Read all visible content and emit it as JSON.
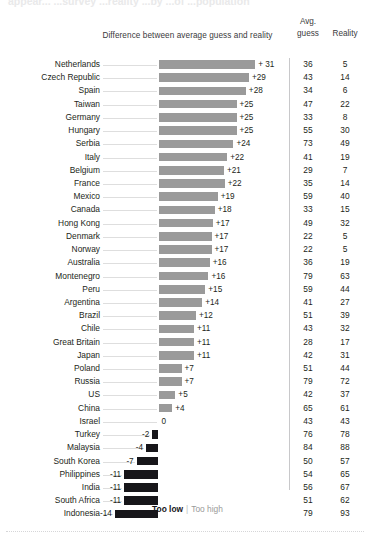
{
  "headline_ghost": "appear... ...survey ...reality ...by ...of ...population",
  "headers": {
    "difference": "Difference between average guess and reality",
    "avg_line1": "Avg.",
    "avg_line2": "guess",
    "reality": "Reality"
  },
  "legend": {
    "too_low": "Too low",
    "separator": "|",
    "too_high": "Too high"
  },
  "colors": {
    "positive_bar": "#9a9a9a",
    "negative_bar": "#17161a",
    "leader_line": "#dedede",
    "divider": "#c8c8ca",
    "text": "#231f20"
  },
  "chart_data": {
    "type": "bar",
    "title": "Difference between average guess and reality",
    "xlabel": "",
    "ylabel": "",
    "orientation": "horizontal",
    "grid": false,
    "legend_position": "bottom",
    "columns": [
      "Country",
      "Difference",
      "Avg. guess",
      "Reality"
    ],
    "categories": [
      "Netherlands",
      "Czech Republic",
      "Spain",
      "Taiwan",
      "Germany",
      "Hungary",
      "Serbia",
      "Italy",
      "Belgium",
      "France",
      "Mexico",
      "Canada",
      "Hong Kong",
      "Denmark",
      "Norway",
      "Australia",
      "Montenegro",
      "Peru",
      "Argentina",
      "Brazil",
      "Chile",
      "Great Britain",
      "Japan",
      "Poland",
      "Russia",
      "US",
      "China",
      "Israel",
      "Turkey",
      "Malaysia",
      "South Korea",
      "Philippines",
      "India",
      "South Africa",
      "Indonesia"
    ],
    "values": [
      31,
      29,
      28,
      25,
      25,
      25,
      24,
      22,
      21,
      22,
      19,
      18,
      17,
      17,
      17,
      16,
      16,
      15,
      14,
      12,
      11,
      11,
      11,
      7,
      7,
      5,
      4,
      0,
      -2,
      -4,
      -7,
      -11,
      -11,
      -11,
      -14
    ],
    "value_labels": [
      "+ 31",
      "+29",
      "+28",
      "+25",
      "+25",
      "+25",
      "+24",
      "+22",
      "+21",
      "+22",
      "+19",
      "+18",
      "+17",
      "+17",
      "+17",
      "+16",
      "+16",
      "+15",
      "+14",
      "+12",
      "+11",
      "+11",
      "+11",
      "+7",
      "+7",
      "+5",
      "+4",
      "0",
      "-2",
      "-4",
      "-7",
      "-11",
      "-11",
      "-11",
      "-14"
    ],
    "avg_guess": [
      36,
      43,
      34,
      47,
      33,
      55,
      73,
      41,
      29,
      35,
      59,
      33,
      49,
      22,
      22,
      36,
      79,
      59,
      41,
      51,
      43,
      28,
      42,
      51,
      79,
      42,
      65,
      43,
      76,
      84,
      50,
      54,
      56,
      51,
      79
    ],
    "reality": [
      5,
      14,
      6,
      22,
      8,
      30,
      49,
      19,
      7,
      14,
      40,
      15,
      32,
      5,
      5,
      19,
      63,
      44,
      27,
      39,
      32,
      17,
      31,
      44,
      72,
      37,
      61,
      43,
      78,
      88,
      57,
      65,
      67,
      62,
      93
    ],
    "xlim": [
      -14,
      31
    ]
  },
  "rows": [
    {
      "country": "Netherlands",
      "label": "+ 31",
      "value": 31,
      "guess": "36",
      "reality": "5"
    },
    {
      "country": "Czech Republic",
      "label": "+29",
      "value": 29,
      "guess": "43",
      "reality": "14"
    },
    {
      "country": "Spain",
      "label": "+28",
      "value": 28,
      "guess": "34",
      "reality": "6"
    },
    {
      "country": "Taiwan",
      "label": "+25",
      "value": 25,
      "guess": "47",
      "reality": "22"
    },
    {
      "country": "Germany",
      "label": "+25",
      "value": 25,
      "guess": "33",
      "reality": "8"
    },
    {
      "country": "Hungary",
      "label": "+25",
      "value": 25,
      "guess": "55",
      "reality": "30"
    },
    {
      "country": "Serbia",
      "label": "+24",
      "value": 24,
      "guess": "73",
      "reality": "49"
    },
    {
      "country": "Italy",
      "label": "+22",
      "value": 22,
      "guess": "41",
      "reality": "19"
    },
    {
      "country": "Belgium",
      "label": "+21",
      "value": 21,
      "guess": "29",
      "reality": "7"
    },
    {
      "country": "France",
      "label": "+22",
      "value": 21.2,
      "guess": "35",
      "reality": "14"
    },
    {
      "country": "Mexico",
      "label": "+19",
      "value": 19,
      "guess": "59",
      "reality": "40"
    },
    {
      "country": "Canada",
      "label": "+18",
      "value": 18,
      "guess": "33",
      "reality": "15"
    },
    {
      "country": "Hong Kong",
      "label": "+17",
      "value": 17.4,
      "guess": "49",
      "reality": "32"
    },
    {
      "country": "Denmark",
      "label": "+17",
      "value": 17,
      "guess": "22",
      "reality": "5"
    },
    {
      "country": "Norway",
      "label": "+17",
      "value": 17,
      "guess": "22",
      "reality": "5"
    },
    {
      "country": "Australia",
      "label": "+16",
      "value": 16.4,
      "guess": "36",
      "reality": "19"
    },
    {
      "country": "Montenegro",
      "label": "+16",
      "value": 16,
      "guess": "79",
      "reality": "63"
    },
    {
      "country": "Peru",
      "label": "+15",
      "value": 15,
      "guess": "59",
      "reality": "44"
    },
    {
      "country": "Argentina",
      "label": "+14",
      "value": 14,
      "guess": "41",
      "reality": "27"
    },
    {
      "country": "Brazil",
      "label": "+12",
      "value": 12,
      "guess": "51",
      "reality": "39"
    },
    {
      "country": "Chile",
      "label": "+11",
      "value": 11.4,
      "guess": "43",
      "reality": "32"
    },
    {
      "country": "Great Britain",
      "label": "+11",
      "value": 11.4,
      "guess": "28",
      "reality": "17"
    },
    {
      "country": "Japan",
      "label": "+11",
      "value": 11.4,
      "guess": "42",
      "reality": "31"
    },
    {
      "country": "Poland",
      "label": "+7",
      "value": 7.4,
      "guess": "51",
      "reality": "44"
    },
    {
      "country": "Russia",
      "label": "+7",
      "value": 7.4,
      "guess": "79",
      "reality": "72"
    },
    {
      "country": "US",
      "label": "+5",
      "value": 5.4,
      "guess": "42",
      "reality": "37"
    },
    {
      "country": "China",
      "label": "+4",
      "value": 4.4,
      "guess": "65",
      "reality": "61"
    },
    {
      "country": "Israel",
      "label": "0",
      "value": 0,
      "guess": "43",
      "reality": "43"
    },
    {
      "country": "Turkey",
      "label": "-2",
      "value": -2,
      "guess": "76",
      "reality": "78"
    },
    {
      "country": "Malaysia",
      "label": "-4",
      "value": -4,
      "guess": "84",
      "reality": "88"
    },
    {
      "country": "South Korea",
      "label": "-7",
      "value": -7,
      "guess": "50",
      "reality": "57"
    },
    {
      "country": "Philippines",
      "label": "-11",
      "value": -11,
      "guess": "54",
      "reality": "65"
    },
    {
      "country": "India",
      "label": "-11",
      "value": -11,
      "guess": "56",
      "reality": "67"
    },
    {
      "country": "South Africa",
      "label": "-11",
      "value": -11,
      "guess": "51",
      "reality": "62"
    },
    {
      "country": "Indonesia",
      "label": "-14",
      "value": -14,
      "guess": "79",
      "reality": "93"
    }
  ]
}
